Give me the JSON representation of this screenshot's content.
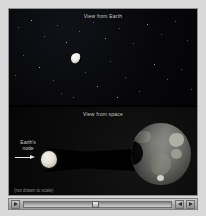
{
  "app": {
    "title": "Lunar Eclipse Animation"
  },
  "panels": {
    "top": {
      "title": "View from Earth",
      "moon_phase": "partially eclipsed"
    },
    "bottom": {
      "title": "View from space",
      "node_label": "Earth's\nnode",
      "scale_note": "(not drawn to scale)"
    }
  },
  "controls": {
    "play_label": "play-icon",
    "step_back_label": "step-back-icon",
    "step_forward_label": "step-forward-icon",
    "progress_percent": 48
  },
  "colors": {
    "background": "#d9d9d9",
    "stage": "#060606",
    "panel_title": "#cfcfcf",
    "moon": "#ecebe4",
    "earth_land": "#b9b9ae",
    "shadow": "#000000",
    "control_bar": "#b4b4b4"
  }
}
